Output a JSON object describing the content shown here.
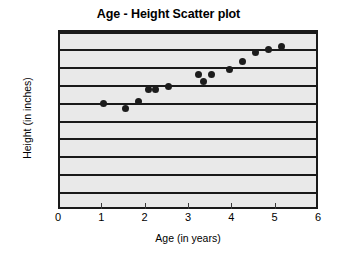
{
  "chart_data": {
    "type": "scatter",
    "title": "Age - Height Scatter plot",
    "xlabel": "Age (in years)",
    "ylabel": "Height (in inches)",
    "xlim": [
      0,
      6
    ],
    "ylim": [
      0,
      50
    ],
    "xticks": [
      "0",
      "1",
      "2",
      "3",
      "4",
      "5",
      "6"
    ],
    "yticks": [
      "0",
      "5",
      "10",
      "15",
      "20",
      "25",
      "30",
      "35",
      "40",
      "45",
      "50"
    ],
    "grid": "horizontal",
    "legend": "none",
    "plot_background_color": "#e9e9e9",
    "gridline_color": "#1a1a1a",
    "marker_color": "#1c1c1c",
    "points": [
      {
        "x": 1.0,
        "y": 30.0
      },
      {
        "x": 1.5,
        "y": 28.5
      },
      {
        "x": 1.8,
        "y": 30.5
      },
      {
        "x": 2.05,
        "y": 34.0
      },
      {
        "x": 2.2,
        "y": 34.0
      },
      {
        "x": 2.5,
        "y": 34.8
      },
      {
        "x": 3.2,
        "y": 38.0
      },
      {
        "x": 3.3,
        "y": 36.2
      },
      {
        "x": 3.5,
        "y": 38.0
      },
      {
        "x": 3.9,
        "y": 39.5
      },
      {
        "x": 4.2,
        "y": 41.8
      },
      {
        "x": 4.5,
        "y": 44.3
      },
      {
        "x": 4.8,
        "y": 45.0
      },
      {
        "x": 5.1,
        "y": 46.0
      }
    ]
  }
}
